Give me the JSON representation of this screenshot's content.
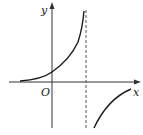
{
  "figure": {
    "type": "function-graph",
    "labels": {
      "y_axis": "y",
      "x_axis": "x",
      "origin": "O"
    },
    "colors": {
      "axis": "#333333",
      "curve": "#1a1a1a",
      "asymptote": "#555555",
      "background": "#ffffff"
    },
    "elements": {
      "vertical_asymptote": "dashed line right of origin",
      "left_branch": "increasing, concave up, approaching asymptote from left, tending to 0 as x → -∞",
      "right_branch": "increasing, concave down, below x-axis, approaching 0 from below"
    }
  }
}
